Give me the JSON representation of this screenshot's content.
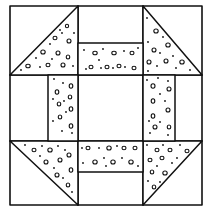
{
  "figure": {
    "colors": {
      "ink": "#111111",
      "background": "#ffffff"
    },
    "outer_border": {
      "x1": 10,
      "y1": 6,
      "x2": 202,
      "y2": 205
    },
    "grid": {
      "cols": [
        10,
        78,
        143,
        202
      ],
      "rows": [
        6,
        75,
        141,
        205
      ]
    },
    "triangles": [
      {
        "name": "top-left",
        "points": [
          [
            10,
            75
          ],
          [
            78,
            6
          ],
          [
            78,
            75
          ]
        ]
      },
      {
        "name": "top-right",
        "points": [
          [
            143,
            6
          ],
          [
            202,
            75
          ],
          [
            143,
            75
          ]
        ]
      },
      {
        "name": "bottom-left",
        "points": [
          [
            10,
            141
          ],
          [
            78,
            141
          ],
          [
            78,
            205
          ]
        ]
      },
      {
        "name": "bottom-right",
        "points": [
          [
            143,
            141
          ],
          [
            202,
            141
          ],
          [
            143,
            205
          ]
        ]
      }
    ],
    "strips": [
      {
        "name": "top",
        "x": 78,
        "y": 43,
        "w": 65,
        "h": 32
      },
      {
        "name": "bottom",
        "x": 78,
        "y": 141,
        "w": 65,
        "h": 31
      },
      {
        "name": "left",
        "x": 48,
        "y": 75,
        "w": 30,
        "h": 66
      },
      {
        "name": "right",
        "x": 143,
        "y": 75,
        "w": 32,
        "h": 66
      }
    ]
  }
}
